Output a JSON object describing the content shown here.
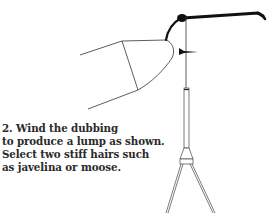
{
  "figure": {
    "elements": [
      "fly-hook",
      "vise-jaws",
      "thread",
      "dubbing-lump",
      "bobbin-tube",
      "bobbin-frame"
    ],
    "line_color": "#1a1a1a"
  },
  "caption": {
    "step_number": "2.",
    "lines": [
      "2.  Wind the dubbing",
      "to produce a lump as shown.",
      "Select two stiff hairs such",
      "as javelina or moose."
    ]
  }
}
